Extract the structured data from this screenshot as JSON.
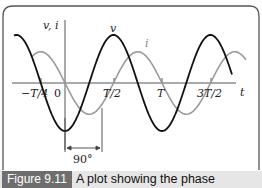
{
  "figure": {
    "caption_label": "Figure 9.11",
    "caption_text": "A plot showing the phase",
    "y_axis_label": "v, i",
    "x_axis_label": "t",
    "curve_labels": {
      "v": "v",
      "i": "i"
    },
    "phase_annotation": "90°",
    "x_ticks": [
      "−T/4",
      "0",
      "T/2",
      "T",
      "3T/2"
    ],
    "colors": {
      "v": "#111111",
      "i": "#9a9a9a",
      "frame": "#555555",
      "caption_label_bg": "#6e6e6e",
      "caption_bg": "#e6e6e6"
    }
  },
  "chart_data": {
    "type": "line",
    "title": "",
    "xlabel": "t",
    "ylabel": "v, i",
    "x_ticks": [
      "-T/4",
      "0",
      "T/2",
      "T",
      "3T/2"
    ],
    "x_tick_values_in_T": [
      -0.25,
      0,
      0.5,
      1.0,
      1.5
    ],
    "xlim_in_T": [
      -0.55,
      1.8
    ],
    "grid": false,
    "legend": "inline labels",
    "series": [
      {
        "name": "v",
        "form": "sinusoid",
        "amplitude_rel": 1.0,
        "period": "T",
        "peak_at_T": [
          -0.5,
          0.5,
          1.5
        ],
        "color": "#111111"
      },
      {
        "name": "i",
        "form": "sinusoid",
        "amplitude_rel": 0.65,
        "period": "T",
        "peak_at_T": [
          -0.25,
          0.75
        ],
        "lags_v_by_deg": 90,
        "color": "#9a9a9a"
      }
    ],
    "annotations": [
      {
        "text": "90°",
        "type": "phase-shift dimension arrow between minima of v and i"
      }
    ]
  }
}
